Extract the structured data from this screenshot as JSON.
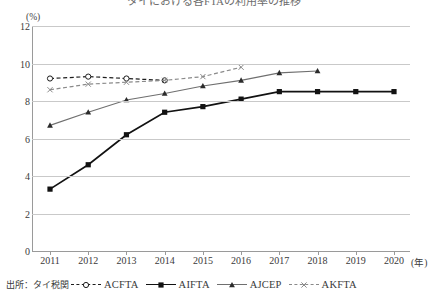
{
  "chart_title": "タイにおける各FTAの利用率の推移",
  "axis_unit": "(%)",
  "x_unit": "(年)",
  "source_note": "出所：タイ税関",
  "axes": {
    "y_ticks": [
      "12",
      "10",
      "8",
      "6",
      "4",
      "2",
      "0"
    ],
    "x_ticks": [
      "2011",
      "2012",
      "2013",
      "2014",
      "2015",
      "2016",
      "2017",
      "2018",
      "2019",
      "2020"
    ]
  },
  "legend": [
    {
      "label": "ACFTA",
      "marker": "open-circle-marker",
      "style": "dashed",
      "color": "#1d1d1d"
    },
    {
      "label": "AIFTA",
      "marker": "filled-square-marker",
      "style": "solid-thick",
      "color": "#121212"
    },
    {
      "label": "AJCEP",
      "marker": "filled-triangle-marker",
      "style": "solid-thin",
      "color": "#6f6f6f"
    },
    {
      "label": "AKFTA",
      "marker": "cross-x-marker",
      "style": "dashed",
      "color": "#8a8a8a"
    }
  ],
  "chart_data": {
    "type": "line",
    "title": "タイにおける各FTAの利用率の推移",
    "xlabel": "(年)",
    "ylabel": "(%)",
    "ylim": [
      0,
      12
    ],
    "ytick_step": 2,
    "grid": true,
    "legend_position": "bottom",
    "x": [
      2011,
      2012,
      2013,
      2014,
      2015,
      2016,
      2017,
      2018,
      2019,
      2020
    ],
    "series": [
      {
        "name": "ACFTA",
        "x": [
          2011,
          2012,
          2013,
          2014
        ],
        "values": [
          9.2,
          9.3,
          9.2,
          9.1
        ],
        "marker": "open-circle-marker",
        "style": "dashed",
        "color": "#1d1d1d"
      },
      {
        "name": "AIFTA",
        "x": [
          2011,
          2012,
          2013,
          2014,
          2015,
          2016,
          2017,
          2018,
          2019,
          2020
        ],
        "values": [
          3.3,
          4.6,
          6.2,
          7.4,
          7.7,
          8.1,
          8.5,
          8.5,
          8.5,
          8.5
        ],
        "marker": "filled-square-marker",
        "style": "solid-thick",
        "color": "#121212"
      },
      {
        "name": "AJCEP",
        "x": [
          2011,
          2012,
          2013,
          2014,
          2015,
          2016,
          2017,
          2018
        ],
        "values": [
          6.7,
          7.4,
          8.05,
          8.4,
          8.8,
          9.1,
          9.5,
          9.6
        ],
        "marker": "filled-triangle-marker",
        "style": "solid-thin",
        "color": "#6f6f6f"
      },
      {
        "name": "AKFTA",
        "x": [
          2011,
          2012,
          2013,
          2014,
          2015,
          2016
        ],
        "values": [
          8.6,
          8.9,
          9.0,
          9.1,
          9.3,
          9.8
        ],
        "marker": "cross-x-marker",
        "style": "dashed",
        "color": "#8a8a8a"
      }
    ]
  }
}
